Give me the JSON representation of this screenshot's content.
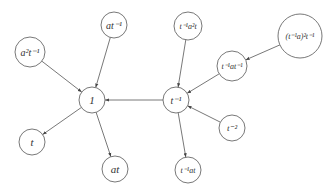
{
  "diagram": {
    "type": "directed-graph",
    "nodes": [
      {
        "id": "one",
        "label": "1",
        "x": 92,
        "y": 100,
        "r": 13,
        "size": 11
      },
      {
        "id": "tinv",
        "label": "t⁻¹",
        "x": 176,
        "y": 100,
        "r": 13,
        "size": 10
      },
      {
        "id": "a2tinv",
        "label": "a²t⁻¹",
        "x": 30,
        "y": 52,
        "r": 15,
        "size": 10
      },
      {
        "id": "atinv",
        "label": "at⁻¹",
        "x": 114,
        "y": 25,
        "r": 13,
        "size": 10
      },
      {
        "id": "tinva2t",
        "label": "t⁻¹a²t",
        "x": 188,
        "y": 26,
        "r": 14,
        "size": 8
      },
      {
        "id": "tinvatinv",
        "label": "t⁻¹at⁻¹",
        "x": 232,
        "y": 66,
        "r": 15,
        "size": 8
      },
      {
        "id": "tinva2tinv",
        "label": "(t⁻¹a)²t⁻¹",
        "x": 300,
        "y": 36,
        "r": 22,
        "size": 8
      },
      {
        "id": "tm2",
        "label": "t⁻²",
        "x": 232,
        "y": 128,
        "r": 13,
        "size": 9
      },
      {
        "id": "tinvat",
        "label": "t⁻¹at",
        "x": 188,
        "y": 170,
        "r": 13,
        "size": 8
      },
      {
        "id": "t",
        "label": "t",
        "x": 32,
        "y": 142,
        "r": 13,
        "size": 11
      },
      {
        "id": "at",
        "label": "at",
        "x": 115,
        "y": 169,
        "r": 13,
        "size": 11
      }
    ],
    "edges": [
      {
        "from": "a2tinv",
        "to": "one"
      },
      {
        "from": "atinv",
        "to": "one"
      },
      {
        "from": "tinv",
        "to": "one"
      },
      {
        "from": "one",
        "to": "t"
      },
      {
        "from": "one",
        "to": "at"
      },
      {
        "from": "tinva2t",
        "to": "tinv"
      },
      {
        "from": "tinvatinv",
        "to": "tinv"
      },
      {
        "from": "tinva2tinv",
        "to": "tinvatinv"
      },
      {
        "from": "tm2",
        "to": "tinv"
      },
      {
        "from": "tinv",
        "to": "tinvat"
      }
    ],
    "colors": {
      "stroke": "#555555",
      "text": "#333333",
      "background": "#ffffff"
    }
  }
}
